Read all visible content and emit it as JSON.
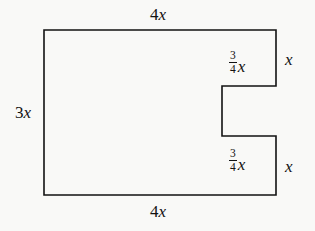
{
  "figure": {
    "kind": "composite-rectangle-with-notch",
    "background_color": "#f9f9f7",
    "stroke_color": "#121212",
    "stroke_width": 1.6,
    "fill_color": "none",
    "outline_points": "44,30 276,30 276,86 222,86 222,136 276,136 276,195 44,195",
    "labels": {
      "top_width": {
        "coefficient": "4",
        "variable": "x",
        "text": "4x"
      },
      "left_height": {
        "coefficient": "3",
        "variable": "x",
        "text": "3x"
      },
      "bottom_width": {
        "coefficient": "4",
        "variable": "x",
        "text": "4x"
      },
      "upper_arm_length": {
        "numerator": "3",
        "denominator": "4",
        "variable": "x",
        "text": "3/4 x"
      },
      "lower_arm_length": {
        "numerator": "3",
        "denominator": "4",
        "variable": "x",
        "text": "3/4 x"
      },
      "upper_arm_height": {
        "coefficient": "",
        "variable": "x",
        "text": "x"
      },
      "lower_arm_height": {
        "coefficient": "",
        "variable": "x",
        "text": "x"
      }
    }
  }
}
